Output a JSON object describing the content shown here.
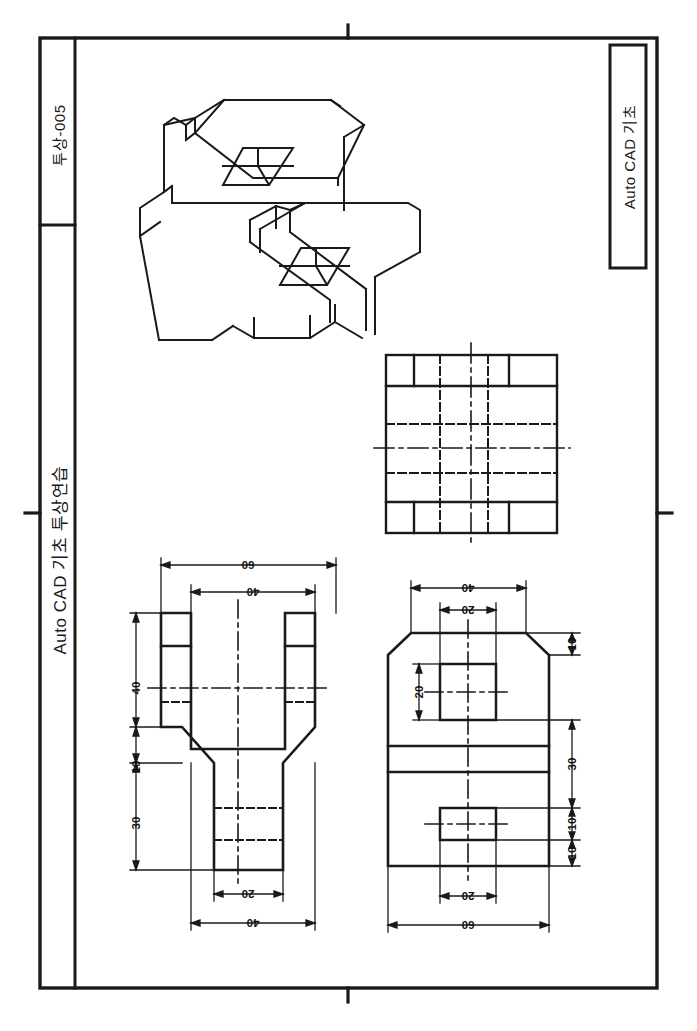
{
  "sheet": {
    "width": 697,
    "height": 1031,
    "background": "#ffffff",
    "line_color": "#1a1a1a",
    "border": {
      "outer_x": 40,
      "outer_y": 38,
      "outer_w": 617,
      "outer_h": 950,
      "name": "drawing-frame"
    },
    "center_marks": [
      "top",
      "bottom",
      "right",
      "left"
    ]
  },
  "title_block_left": {
    "code_label": "투상-005",
    "main_label": "Auto CAD 기초 투상연습",
    "column_x": 40,
    "column_w": 35,
    "divider_y": 225
  },
  "title_block_right": {
    "title_label": "Auto CAD 기초",
    "box_x": 610,
    "box_y": 45,
    "box_w": 36,
    "box_h": 223
  },
  "views": {
    "isometric": {
      "name": "isometric-pictorial-view",
      "caption": ""
    },
    "top_view": {
      "name": "top-orthographic-view",
      "caption": ""
    },
    "front_view": {
      "name": "front-orthographic-view",
      "dimensions": [
        "60",
        "40",
        "40",
        "10",
        "30",
        "20",
        "40"
      ]
    },
    "side_view": {
      "name": "side-orthographic-view",
      "dimensions": [
        "40",
        "20",
        "10",
        "20",
        "30",
        "10",
        "10",
        "20",
        "60"
      ]
    }
  },
  "dimensions": {
    "front_top_60": "60",
    "front_top_40": "40",
    "front_left_40": "40",
    "front_left_10": "10",
    "front_left_30": "30",
    "front_bottom_20": "20",
    "front_bottom_40": "40",
    "side_top_40": "40",
    "side_top_20": "20",
    "side_right_10a": "10",
    "side_left_20": "20",
    "side_right_30": "30",
    "side_right_10b": "10",
    "side_right_10c": "10",
    "side_bottom_20": "20",
    "side_bottom_60": "60"
  }
}
